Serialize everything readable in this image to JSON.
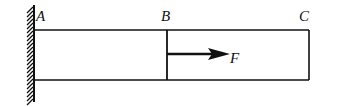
{
  "diagram": {
    "type": "cantilever-bar-with-force",
    "points": [
      {
        "id": "A",
        "label": "A"
      },
      {
        "id": "B",
        "label": "B"
      },
      {
        "id": "C",
        "label": "C"
      }
    ],
    "force": {
      "label": "F",
      "direction": "right",
      "applied_at": "B"
    },
    "support": {
      "type": "fixed-wall",
      "at": "A"
    },
    "colors": {
      "line": "#111111",
      "background": "#ffffff"
    }
  }
}
